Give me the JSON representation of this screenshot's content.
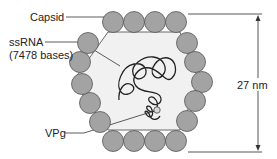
{
  "diagram": {
    "title": "",
    "labels": {
      "capsid": "Capsid",
      "ssrna": "ssRNA",
      "ssrna_detail": "(7478 bases)",
      "vpg": "VPg",
      "dimension": "27 nm"
    },
    "colors": {
      "subunit_fill": "#a3a3a3",
      "subunit_stroke": "#555555",
      "hexagon_fill": "#f1f1f1",
      "line": "#333333",
      "background": "#ffffff"
    },
    "capsid_subunit_count": 20
  }
}
